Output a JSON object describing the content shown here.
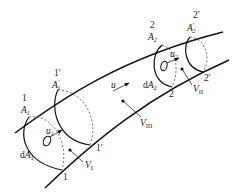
{
  "figure": {
    "type": "streamtube control-volume diagram",
    "stroke_color": "#111111",
    "background": "#ffffff"
  },
  "sections": [
    {
      "id": "1",
      "label": "1",
      "area_label": "A",
      "area_sub": "1",
      "area_prime": ""
    },
    {
      "id": "1prime",
      "label": "1′",
      "area_label": "A",
      "area_sub": "1",
      "area_prime": "′"
    },
    {
      "id": "2",
      "label": "2",
      "area_label": "A",
      "area_sub": "2",
      "area_prime": ""
    },
    {
      "id": "2prime",
      "label": "2′",
      "area_label": "A",
      "area_sub": "2",
      "area_prime": "′"
    }
  ],
  "bottom_labels": {
    "s1": "1",
    "s1p": "1′",
    "s2": "2",
    "s2p": "2′"
  },
  "elements": {
    "dA1": {
      "prefix": "d",
      "var": "A",
      "sub": "1"
    },
    "dA2": {
      "prefix": "d",
      "var": "A",
      "sub": "2"
    },
    "u1": {
      "var": "u",
      "sub": "1"
    },
    "u2": {
      "var": "u",
      "sub": "2"
    },
    "u": {
      "var": "u"
    }
  },
  "volumes": {
    "V1": {
      "var": "V",
      "sub": "I"
    },
    "V2": {
      "var": "V",
      "sub": "II"
    },
    "V3": {
      "var": "V",
      "sub": "III"
    }
  }
}
